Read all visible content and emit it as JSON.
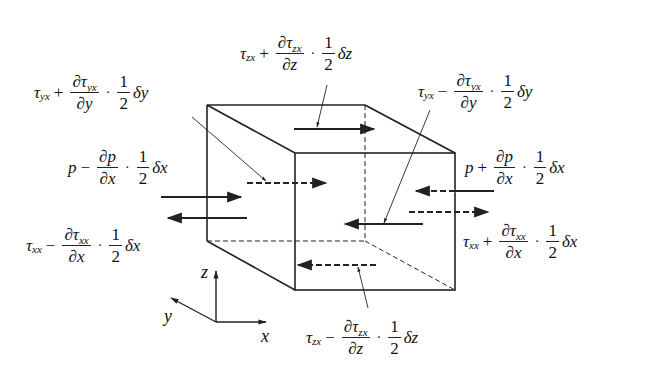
{
  "diagram": {
    "colors": {
      "line": "#222222",
      "background": "#ffffff"
    },
    "axes": {
      "x": "x",
      "y": "y",
      "z": "z"
    },
    "labels": {
      "tzx_top": {
        "base": "τ",
        "base_sub": "zx",
        "op": "+",
        "num": "∂τ",
        "num_sub": "zx",
        "den": "∂z",
        "dot": "·",
        "half_num": "1",
        "half_den": "2",
        "delta": "δz"
      },
      "tyx_front": {
        "base": "τ",
        "base_sub": "yx",
        "op": "+",
        "num": "∂τ",
        "num_sub": "yx",
        "den": "∂y",
        "dot": "·",
        "half_num": "1",
        "half_den": "2",
        "delta": "δy"
      },
      "tyx_back": {
        "base": "τ",
        "base_sub": "yx",
        "op": "−",
        "num": "∂τ",
        "num_sub": "yx",
        "den": "∂y",
        "dot": "·",
        "half_num": "1",
        "half_den": "2",
        "delta": "δy"
      },
      "p_left": {
        "base": "p",
        "op": "−",
        "num": "∂p",
        "den": "∂x",
        "dot": "·",
        "half_num": "1",
        "half_den": "2",
        "delta": "δx"
      },
      "p_right": {
        "base": "p",
        "op": "+",
        "num": "∂p",
        "den": "∂x",
        "dot": "·",
        "half_num": "1",
        "half_den": "2",
        "delta": "δx"
      },
      "txx_left": {
        "base": "τ",
        "base_sub": "xx",
        "op": "−",
        "num": "∂τ",
        "num_sub": "xx",
        "den": "∂x",
        "dot": "·",
        "half_num": "1",
        "half_den": "2",
        "delta": "δx"
      },
      "txx_right": {
        "base": "τ",
        "base_sub": "xx",
        "op": "+",
        "num": "∂τ",
        "num_sub": "xx",
        "den": "∂x",
        "dot": "·",
        "half_num": "1",
        "half_den": "2",
        "delta": "δx"
      },
      "tzx_bottom": {
        "base": "τ",
        "base_sub": "zx",
        "op": "−",
        "num": "∂τ",
        "num_sub": "zx",
        "den": "∂z",
        "dot": "·",
        "half_num": "1",
        "half_den": "2",
        "delta": "δz"
      }
    }
  }
}
